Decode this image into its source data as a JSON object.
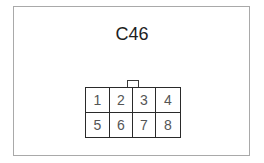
{
  "connector": {
    "title": "C46",
    "pins": [
      {
        "label": "1"
      },
      {
        "label": "2"
      },
      {
        "label": "3"
      },
      {
        "label": "4"
      },
      {
        "label": "5"
      },
      {
        "label": "6"
      },
      {
        "label": "7"
      },
      {
        "label": "8"
      }
    ],
    "rows": 2,
    "columns": 4
  },
  "colors": {
    "frame_border": "#a9a9a9",
    "grid_lines": "#2a2a2a",
    "pin_text": "#555555",
    "title_text": "#1e1e1e"
  }
}
